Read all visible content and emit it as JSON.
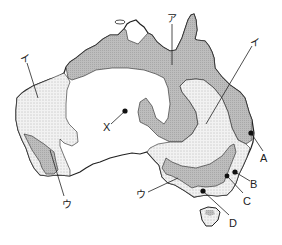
{
  "map": {
    "subject": "Australia",
    "colors": {
      "background": "#ffffff",
      "outline": "#222222",
      "region_a_fill": "#b5b5b5",
      "region_b_dot": "#7a7a7a",
      "region_b_base": "#f2f2f2"
    },
    "region_labels": {
      "a": "ア",
      "i_west": "イ",
      "i_east": "イ",
      "u_west": "ウ",
      "u_south": "ウ"
    },
    "point_labels": {
      "x": "X",
      "a": "A",
      "b": "B",
      "c": "C",
      "d": "D"
    },
    "legend_semantics": {
      "gray_fill": "region ア",
      "dotted_fill": "region イ",
      "plain_white": "unshaded interior"
    }
  }
}
